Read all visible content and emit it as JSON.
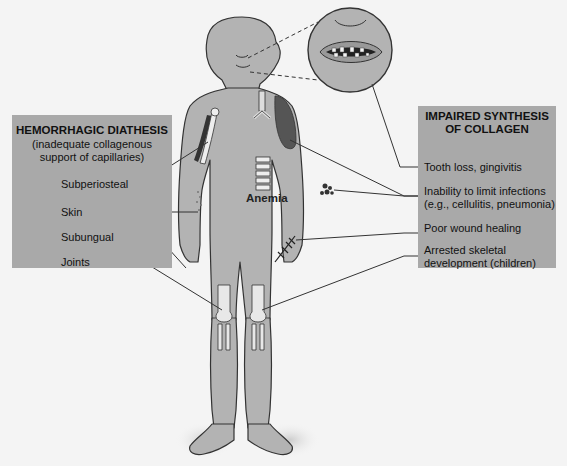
{
  "diagram": {
    "left_box": {
      "title": "HEMORRHAGIC DIATHESIS",
      "subtitle_line1": "(inadequate collagenous",
      "subtitle_line2": "support of capillaries)",
      "labels": [
        "Subperiosteal",
        "Skin",
        "Subungual",
        "Joints"
      ]
    },
    "right_box": {
      "title_line1": "IMPAIRED SYNTHESIS",
      "title_line2": "OF COLLAGEN",
      "labels": [
        {
          "line1": "Tooth loss, gingivitis",
          "line2": ""
        },
        {
          "line1": "Inability to limit infections",
          "line2": "(e.g., cellulitis, pneumonia)"
        },
        {
          "line1": "Poor wound healing",
          "line2": ""
        },
        {
          "line1": "Arrested skeletal",
          "line2": "development (children)"
        }
      ]
    },
    "center_label": "Anemia",
    "inset": "mouth-closeup-showing-missing-teeth",
    "colors": {
      "box_fill": "#a9a9a9",
      "body_fill": "#b3b3b3",
      "outline": "#333333",
      "background": "#f4f4f4"
    }
  }
}
